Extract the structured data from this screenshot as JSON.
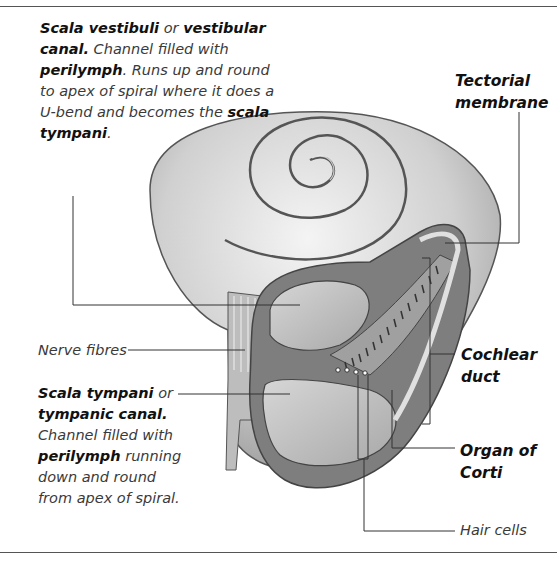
{
  "diagram": {
    "labels": {
      "scala_vestibuli": {
        "term1": "Scala vestibuli",
        "conj": " or ",
        "term2": "vestibular canal.",
        "text1": " Channel filled with ",
        "term3": "perilymph",
        "text2": ". Runs up and round to apex of spiral where it does a U-bend and becomes the ",
        "term4": "scala tympani",
        "text3": "."
      },
      "tectorial_membrane": "Tectorial membrane",
      "nerve_fibres": "Nerve fibres",
      "scala_tympani": {
        "term1": "Scala tympani",
        "conj": " or ",
        "term2": "tympanic canal.",
        "text1": " Channel filled with ",
        "term3": "perilymph",
        "text2": " running down and round from apex of spiral."
      },
      "cochlear_duct": "Cochlear duct",
      "organ_of_corti": "Organ of Corti",
      "hair_cells": "Hair cells"
    },
    "colors": {
      "rule": "#555555",
      "leader": "#333333",
      "shell_light": "#e8e8e8",
      "shell_mid": "#b8b8b8",
      "shell_dark": "#6a6a6a"
    }
  }
}
